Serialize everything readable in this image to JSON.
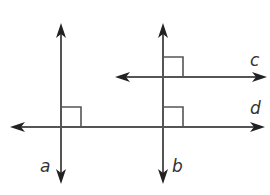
{
  "diagram": {
    "type": "geometry-lines",
    "colors": {
      "line": "#555555",
      "arrow": "#222222",
      "marker": "#555555",
      "label": "#333333",
      "background": "#ffffff"
    },
    "lines": [
      {
        "id": "a",
        "label": "a",
        "orientation": "vertical",
        "x": 61,
        "y1": 23,
        "y2": 184,
        "label_pos": [
          40,
          172
        ]
      },
      {
        "id": "b",
        "label": "b",
        "orientation": "vertical",
        "x": 163,
        "y1": 23,
        "y2": 184,
        "label_pos": [
          172,
          172
        ]
      },
      {
        "id": "c",
        "label": "c",
        "orientation": "horizontal",
        "y": 77,
        "x1": 115,
        "x2": 267,
        "label_pos": [
          250,
          66
        ]
      },
      {
        "id": "d",
        "label": "d",
        "orientation": "horizontal",
        "y": 127,
        "x1": 10,
        "x2": 265,
        "label_pos": [
          250,
          114
        ]
      }
    ],
    "right_angle_markers": [
      {
        "at": "a-d",
        "x": 61,
        "y": 107,
        "size": 20
      },
      {
        "at": "b-c",
        "x": 163,
        "y": 57,
        "size": 20
      },
      {
        "at": "b-d",
        "x": 163,
        "y": 107,
        "size": 20
      }
    ]
  }
}
